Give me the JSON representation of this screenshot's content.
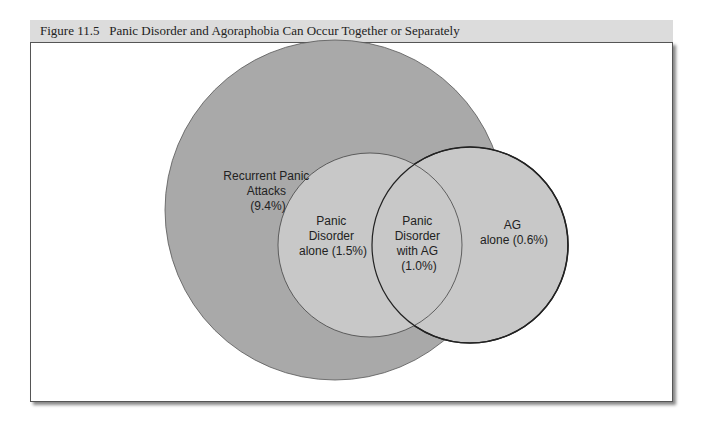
{
  "figure": {
    "number_label": "Figure 11.5",
    "title": "Panic Disorder and Agoraphobia Can Occur Together or Separately"
  },
  "diagram": {
    "type": "venn",
    "regions": [
      {
        "name": "recurrent-panic-attacks",
        "lines": [
          "Recurrent Panic",
          "Attacks",
          "(9.4%)"
        ],
        "percent": 9.4
      },
      {
        "name": "panic-disorder-alone",
        "lines": [
          "Panic",
          "Disorder",
          "alone (1.5%)"
        ],
        "percent": 1.5
      },
      {
        "name": "panic-disorder-with-ag",
        "lines": [
          "Panic",
          "Disorder",
          "with AG",
          "(1.0%)"
        ],
        "percent": 1.0
      },
      {
        "name": "ag-alone",
        "lines": [
          "AG",
          "alone (0.6%)"
        ],
        "percent": 0.6
      }
    ],
    "colors": {
      "large_circle": "#a9a9a9",
      "inner_circles": "#c8c8c8",
      "stroke": "#333333"
    }
  }
}
